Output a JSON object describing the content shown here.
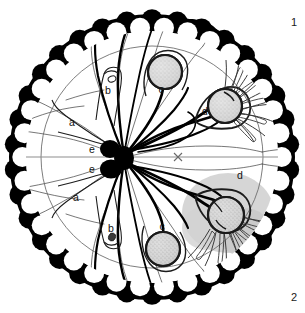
{
  "figure": {
    "type": "biological-schematic-diagram",
    "panel_numbers": {
      "top_right": "1",
      "bottom_right": "2"
    },
    "background_color": "#ffffff",
    "ink_color": "#000000",
    "outer_ring_color": "#000000",
    "inner_circle_stroke": "#6b6b6b",
    "midline_color": "#8a8a8a",
    "cell_fill": "#d2d2d2",
    "cell_stroke": "#1a1a1a",
    "shadow_blob_color": "#c9c9c9"
  },
  "geometry": {
    "outer_circle": {
      "cx": 152,
      "cy": 157,
      "r": 143
    },
    "scallop_band": {
      "inner_r": 126,
      "outer_r": 143,
      "lobes": 34
    },
    "inner_thin_circle": {
      "cx": 152,
      "cy": 157,
      "r": 111
    },
    "midline_y": 157,
    "center_mark": {
      "x": 178,
      "y": 157,
      "glyph": "x"
    },
    "nuclei": [
      {
        "label": "e",
        "cx": 110,
        "cy": 149,
        "rx": 10,
        "ry": 9
      },
      {
        "label": "e",
        "cx": 110,
        "cy": 168,
        "rx": 11,
        "ry": 9
      }
    ],
    "hub": {
      "cx": 124,
      "cy": 158
    }
  },
  "labels": [
    {
      "id": "label-a-top",
      "text": "a",
      "x": 72,
      "y": 126
    },
    {
      "id": "label-a-bottom",
      "text": "a",
      "x": 76,
      "y": 201
    },
    {
      "id": "label-b-top",
      "text": "b",
      "x": 108,
      "y": 94
    },
    {
      "id": "label-b-bottom",
      "text": "b",
      "x": 111,
      "y": 232
    },
    {
      "id": "label-c-top",
      "text": "c",
      "x": 161,
      "y": 93
    },
    {
      "id": "label-c-bottom",
      "text": "c",
      "x": 162,
      "y": 230
    },
    {
      "id": "label-d-top",
      "text": "d",
      "x": 205,
      "y": 115
    },
    {
      "id": "label-d-bottom",
      "text": "d",
      "x": 240,
      "y": 179
    },
    {
      "id": "label-e-top",
      "text": "e",
      "x": 92,
      "y": 153
    },
    {
      "id": "label-e-bottom",
      "text": "e",
      "x": 92,
      "y": 172
    }
  ],
  "cells": [
    {
      "id": "cell-c-top",
      "label": "c",
      "cx": 165,
      "cy": 72,
      "r": 17,
      "fill": "#dcdcdc",
      "texture": "stippled"
    },
    {
      "id": "cell-c-bottom",
      "label": "c",
      "cx": 163,
      "cy": 249,
      "r": 17,
      "fill": "#d5d5d5",
      "texture": "stippled"
    },
    {
      "id": "cell-d-top",
      "label": "d",
      "cx": 225,
      "cy": 106,
      "r": 17,
      "fill": "#d8d8d8",
      "texture": "stippled",
      "has_cilia": true
    },
    {
      "id": "cell-d-bottom",
      "label": "d",
      "cx": 226,
      "cy": 215,
      "r": 18,
      "fill": "#c8c8c8",
      "texture": "stippled",
      "has_cilia": true,
      "has_shadow": true
    }
  ],
  "legend_keys": [
    "a",
    "b",
    "c",
    "d",
    "e"
  ]
}
